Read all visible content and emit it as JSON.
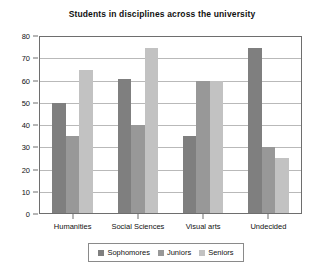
{
  "chart_data": {
    "type": "bar",
    "title": "Students in disciplines across the university",
    "xlabel": "",
    "ylabel": "",
    "ylim": [
      0,
      80
    ],
    "yticks": [
      0,
      10,
      20,
      30,
      40,
      50,
      60,
      70,
      80
    ],
    "grid": true,
    "legend_position": "bottom",
    "categories": [
      "Humanities",
      "Social Sciences",
      "Visual arts",
      "Undecided"
    ],
    "series": [
      {
        "name": "Sophomores",
        "color": "#7f7f7f",
        "values": [
          50,
          61,
          35,
          75
        ]
      },
      {
        "name": "Juniors",
        "color": "#989898",
        "values": [
          35,
          40,
          60,
          30
        ]
      },
      {
        "name": "Seniors",
        "color": "#c2c2c2",
        "values": [
          65,
          75,
          60,
          25
        ]
      }
    ]
  },
  "axis_colors": {
    "frame": "#6e6e6e",
    "grid": "#b9b9b9",
    "text": "#111111"
  }
}
